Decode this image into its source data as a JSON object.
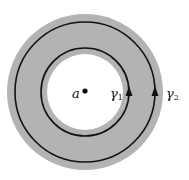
{
  "diagram": {
    "center_point_label": "a",
    "contours": [
      {
        "name": "γ",
        "subscript": "1",
        "role": "inner contour"
      },
      {
        "name": "γ",
        "subscript": "2",
        "role": "outer contour"
      }
    ],
    "colors": {
      "annulus_fill": "#b3b3b3",
      "hole_fill": "#ffffff",
      "stroke": "#111111"
    }
  }
}
